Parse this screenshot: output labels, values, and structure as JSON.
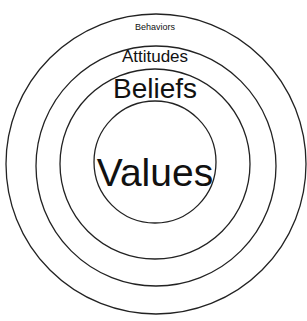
{
  "diagram": {
    "type": "concentric-circles",
    "layers": [
      {
        "label": "Behaviors",
        "level": "outermost"
      },
      {
        "label": "Attitudes",
        "level": "second"
      },
      {
        "label": "Beliefs",
        "level": "third"
      },
      {
        "label": "Values",
        "level": "core"
      }
    ],
    "colors": {
      "stroke": "#222222",
      "background": "#ffffff",
      "text": "#111111"
    }
  }
}
